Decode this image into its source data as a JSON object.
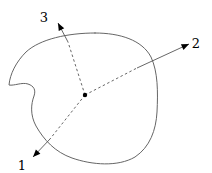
{
  "figure": {
    "type": "diagram",
    "background_color": "#ffffff",
    "stroke_color": "#555555",
    "accent_color": "#000000",
    "canvas": {
      "width": 212,
      "height": 173
    }
  },
  "body_outline": {
    "name": "blob-outline",
    "description": "closed freeform rounded-square region with a concave notch on the left side",
    "stroke_color": "#666666",
    "stroke_width": 1,
    "fill": "none",
    "path": "M 95,33 C 120,33 142,40 151,57 C 158,72 158,92 157,112 C 156,130 150,147 135,157 C 118,167 92,165 72,158 C 55,152 44,140 36,126 C 30,115 31,104 34,96 C 36,90 34,86 28,84 C 22,82 14,86 9,85 C 10,74 16,62 26,52 C 40,39 68,33 95,33 Z"
  },
  "center_point": {
    "name": "body-center-point",
    "x": 85,
    "y": 95,
    "radius": 2.2,
    "color": "#000000"
  },
  "axes": [
    {
      "id": "axis-1",
      "label": "1",
      "label_x": 22,
      "label_y": 166,
      "start_x": 85,
      "start_y": 95,
      "boundary_x": 50,
      "boundary_y": 139,
      "tip_x": 33,
      "tip_y": 157,
      "dashed_inside": true,
      "solid_outside": true,
      "arrowhead": true,
      "direction": "down-left"
    },
    {
      "id": "axis-2",
      "label": "2",
      "label_x": 196,
      "label_y": 44,
      "start_x": 85,
      "start_y": 95,
      "boundary_x": 137,
      "boundary_y": 68,
      "tip_x": 189,
      "tip_y": 44,
      "dashed_inside": true,
      "solid_outside": true,
      "arrowhead": true,
      "direction": "up-right"
    },
    {
      "id": "axis-3",
      "label": "3",
      "label_x": 44,
      "label_y": 18,
      "start_x": 85,
      "start_y": 95,
      "boundary_x": 68,
      "boundary_y": 42,
      "tip_x": 58,
      "tip_y": 23,
      "dashed_inside": true,
      "solid_outside": true,
      "arrowhead": true,
      "direction": "up-left"
    }
  ],
  "style": {
    "dash_pattern": "2.5 2.5",
    "axis_stroke_width": 0.9,
    "label_font_size": 13
  }
}
